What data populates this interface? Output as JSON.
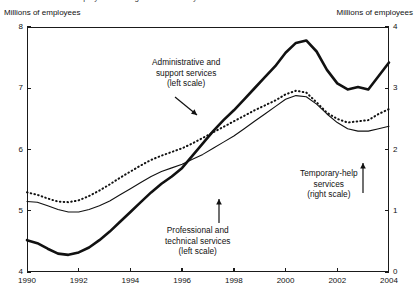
{
  "figure": {
    "clipped_title": "Business services employment has grown in recent years",
    "left_axis_caption": "Millions of employees",
    "right_axis_caption": "Millions of employees"
  },
  "annotations": {
    "admin": {
      "line1": "Administrative and",
      "line2": "support services",
      "line3": "(left scale)"
    },
    "prof": {
      "line1": "Professional and",
      "line2": "technical services",
      "line3": "(left scale)"
    },
    "temp": {
      "line1": "Temporary-help",
      "line2": "services",
      "line3": "(right scale)"
    }
  },
  "chart_data": {
    "type": "line",
    "title": "Business services employment has grown in recent years",
    "xlabel": "",
    "ylabel": "Millions of employees",
    "y2label": "Millions of employees",
    "xlim": [
      1990,
      2004
    ],
    "ylim": [
      4,
      8
    ],
    "y2lim": [
      0,
      4
    ],
    "yticks": [
      4,
      5,
      6,
      7,
      8
    ],
    "y2ticks": [
      0,
      1,
      2,
      3,
      4
    ],
    "xticks": [
      1990,
      1992,
      1994,
      1996,
      1998,
      2000,
      2002,
      2004
    ],
    "grid": false,
    "legend": "annotations-inline",
    "series": [
      {
        "name": "Administrative and support services",
        "axis": "left",
        "style": "thick-solid",
        "x": [
          1990.0,
          1990.4,
          1990.8,
          1991.2,
          1991.6,
          1992.0,
          1992.4,
          1992.8,
          1993.2,
          1993.6,
          1994.0,
          1994.4,
          1994.8,
          1995.2,
          1995.6,
          1996.0,
          1996.4,
          1996.8,
          1997.2,
          1997.6,
          1998.0,
          1998.4,
          1998.8,
          1999.2,
          1999.6,
          2000.0,
          2000.4,
          2000.8,
          2001.2,
          2001.6,
          2002.0,
          2002.4,
          2002.8,
          2003.2,
          2003.6,
          2004.0
        ],
        "y": [
          4.52,
          4.47,
          4.38,
          4.3,
          4.28,
          4.32,
          4.4,
          4.52,
          4.66,
          4.82,
          4.98,
          5.14,
          5.3,
          5.44,
          5.56,
          5.7,
          5.9,
          6.1,
          6.3,
          6.48,
          6.64,
          6.82,
          7.0,
          7.18,
          7.36,
          7.58,
          7.74,
          7.78,
          7.6,
          7.3,
          7.08,
          6.98,
          7.02,
          6.98,
          7.2,
          7.42
        ]
      },
      {
        "name": "Professional and technical services",
        "axis": "left",
        "style": "thin-solid",
        "x": [
          1990.0,
          1990.4,
          1990.8,
          1991.2,
          1991.6,
          1992.0,
          1992.4,
          1992.8,
          1993.2,
          1993.6,
          1994.0,
          1994.4,
          1994.8,
          1995.2,
          1995.6,
          1996.0,
          1996.4,
          1996.8,
          1997.2,
          1997.6,
          1998.0,
          1998.4,
          1998.8,
          1999.2,
          1999.6,
          2000.0,
          2000.4,
          2000.8,
          2001.2,
          2001.6,
          2002.0,
          2002.4,
          2002.8,
          2003.2,
          2003.6,
          2004.0
        ],
        "y": [
          5.15,
          5.14,
          5.08,
          5.02,
          4.98,
          4.98,
          5.02,
          5.08,
          5.16,
          5.26,
          5.36,
          5.46,
          5.56,
          5.64,
          5.7,
          5.76,
          5.84,
          5.92,
          6.02,
          6.12,
          6.22,
          6.34,
          6.46,
          6.58,
          6.7,
          6.82,
          6.88,
          6.86,
          6.74,
          6.58,
          6.44,
          6.34,
          6.3,
          6.3,
          6.34,
          6.38
        ]
      },
      {
        "name": "Temporary-help services",
        "axis": "right",
        "style": "dotted",
        "x": [
          1990.0,
          1990.4,
          1990.8,
          1991.2,
          1991.6,
          1992.0,
          1992.4,
          1992.8,
          1993.2,
          1993.6,
          1994.0,
          1994.4,
          1994.8,
          1995.2,
          1995.6,
          1996.0,
          1996.4,
          1996.8,
          1997.2,
          1997.6,
          1998.0,
          1998.4,
          1998.8,
          1999.2,
          1999.6,
          2000.0,
          2000.4,
          2000.8,
          2001.2,
          2001.6,
          2002.0,
          2002.4,
          2002.8,
          2003.2,
          2003.6,
          2004.0
        ],
        "y": [
          1.3,
          1.26,
          1.2,
          1.15,
          1.14,
          1.17,
          1.24,
          1.33,
          1.43,
          1.54,
          1.64,
          1.74,
          1.83,
          1.9,
          1.96,
          2.02,
          2.1,
          2.19,
          2.28,
          2.37,
          2.46,
          2.55,
          2.64,
          2.72,
          2.8,
          2.9,
          2.96,
          2.93,
          2.77,
          2.6,
          2.5,
          2.44,
          2.46,
          2.48,
          2.58,
          2.66
        ]
      }
    ]
  }
}
